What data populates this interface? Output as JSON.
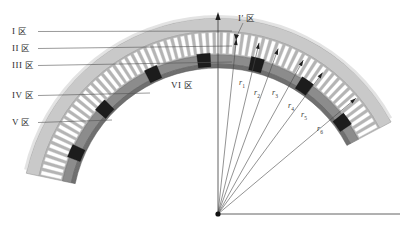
{
  "figure": {
    "background_color": "#ffffff",
    "line_color": "#4a4a4a",
    "colors": {
      "outer_band": "#c9c9c9",
      "outer_band_edge": "#9a9a9a",
      "tooth_fill": "#ffffff",
      "tooth_gap": "#b4b4b4",
      "inner_band": "#8c8c8c",
      "inner_band_dark": "#6f6f6f",
      "black_segment": "#1c1c1c",
      "leader": "#555555",
      "axis": "#3a3a3a"
    },
    "origin": {
      "x": 218,
      "y": 214,
      "label": ""
    }
  },
  "zone_labels": [
    {
      "id": "zone-1",
      "roman": "I",
      "zone": "区",
      "x": 12,
      "y": 27,
      "leader_to_x": 232,
      "leader_to_y": 31
    },
    {
      "id": "zone-2",
      "roman": "II",
      "zone": "区",
      "x": 12,
      "y": 44,
      "leader_to_x": 232,
      "leader_to_y": 46
    },
    {
      "id": "zone-3",
      "roman": "III",
      "zone": "区",
      "x": 12,
      "y": 61,
      "leader_to_x": 232,
      "leader_to_y": 62
    },
    {
      "id": "zone-4",
      "roman": "IV",
      "zone": "区",
      "x": 12,
      "y": 91,
      "leader_to_x": 150,
      "leader_to_y": 93
    },
    {
      "id": "zone-5",
      "roman": "V",
      "zone": "区",
      "x": 12,
      "y": 118,
      "leader_to_x": 112,
      "leader_to_y": 120
    }
  ],
  "inner_labels": [
    {
      "id": "zone-6",
      "roman": "VI",
      "zone": "区",
      "x": 171,
      "y": 81
    },
    {
      "id": "zone-1-prime",
      "roman": "I′",
      "zone": "区",
      "x": 238,
      "y": 14
    }
  ],
  "radii": [
    {
      "name": "r",
      "sub": "1",
      "label_x": 239,
      "label_y": 78,
      "angle_deg": 84.0,
      "length": 176
    },
    {
      "name": "r",
      "sub": "2",
      "label_x": 254,
      "label_y": 88,
      "angle_deg": 76.5,
      "length": 176
    },
    {
      "name": "r",
      "sub": "3",
      "label_x": 272,
      "label_y": 88,
      "angle_deg": 70.0,
      "length": 176
    },
    {
      "name": "r",
      "sub": "4",
      "label_x": 288,
      "label_y": 101,
      "angle_deg": 61.0,
      "length": 176
    },
    {
      "name": "r",
      "sub": "5",
      "label_x": 301,
      "label_y": 110,
      "angle_deg": 53.5,
      "length": 176
    },
    {
      "name": "r",
      "sub": "6",
      "label_x": 317,
      "label_y": 124,
      "angle_deg": 40.0,
      "length": 180
    }
  ],
  "axes": {
    "vertical": {
      "x": 218,
      "y_top": 12,
      "y_bottom": 214,
      "arrow": "up"
    },
    "horizontal": {
      "y": 214,
      "x_left": 218,
      "x_right": 400,
      "arrow": "none"
    }
  },
  "arch": {
    "center_x": 218,
    "center_y": 214,
    "outer_radius": 196,
    "inner_radius": 150,
    "tooth_count": 62,
    "start_angle_deg": 28,
    "end_angle_deg": 168,
    "black_segment_positions": [
      0.06,
      0.2,
      0.34,
      0.48,
      0.62,
      0.78,
      0.92
    ]
  }
}
